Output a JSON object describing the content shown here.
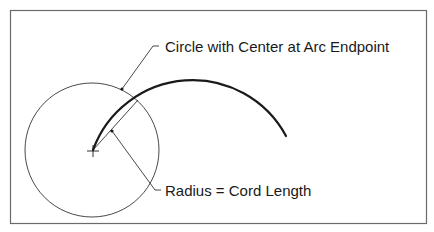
{
  "diagram": {
    "labels": {
      "circle_label": "Circle with Center at Arc Endpoint",
      "radius_label": "Radius = Cord Length"
    },
    "colors": {
      "background": "#ffffff",
      "frame": "#6b6b6b",
      "line": "#1a1a1a"
    },
    "elements": {
      "frame": "rectangular border",
      "circle": "thin circle centered at arc endpoint",
      "arc": "thick curved arc",
      "radius_line": "thin straight chord from circle center to arc/circle intersection",
      "center_mark": "crosshair at arc endpoint"
    }
  }
}
